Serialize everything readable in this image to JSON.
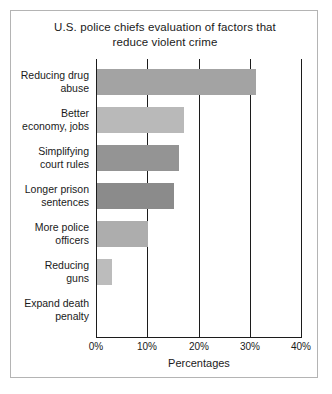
{
  "chart_data": {
    "type": "bar",
    "orientation": "horizontal",
    "title": "U.S. police chiefs evaluation of factors that reduce violent crime",
    "title_line1": "U.S. police chiefs evaluation of factors that",
    "title_line2": "reduce violent crime",
    "xlabel": "Percentages",
    "ylabel": "",
    "xlim": [
      0,
      40
    ],
    "xticks": [
      0,
      10,
      20,
      30,
      40
    ],
    "xtick_labels": [
      "0%",
      "10%",
      "20%",
      "30%",
      "40%"
    ],
    "grid": true,
    "legend": "none",
    "categories": [
      "Reducing drug abuse",
      "Better economy, jobs",
      "Simplifying court rules",
      "Longer prison sentences",
      "More police officers",
      "Reducing guns",
      "Expand death penalty"
    ],
    "values": [
      31,
      17,
      16,
      15,
      10,
      3,
      0
    ],
    "bars": [
      {
        "label_line1": "Reducing drug",
        "label_line2": "abuse",
        "value": 31,
        "color": "#a3a3a3"
      },
      {
        "label_line1": "Better",
        "label_line2": "economy, jobs",
        "value": 17,
        "color": "#b9b9b9"
      },
      {
        "label_line1": "Simplifying",
        "label_line2": "court rules",
        "value": 16,
        "color": "#949494"
      },
      {
        "label_line1": "Longer prison",
        "label_line2": "sentences",
        "value": 15,
        "color": "#8b8b8b"
      },
      {
        "label_line1": "More police",
        "label_line2": "officers",
        "value": 10,
        "color": "#adadad"
      },
      {
        "label_line1": "Reducing",
        "label_line2": "guns",
        "value": 3,
        "color": "#bcbcbc"
      },
      {
        "label_line1": "Expand death",
        "label_line2": "penalty",
        "value": 0,
        "color": "#b0b0b0"
      }
    ]
  },
  "colors": {
    "frame_border": "#b4b4b4",
    "axis": "#1c1c1c",
    "text": "#1a1a1a",
    "background": "#ffffff"
  }
}
